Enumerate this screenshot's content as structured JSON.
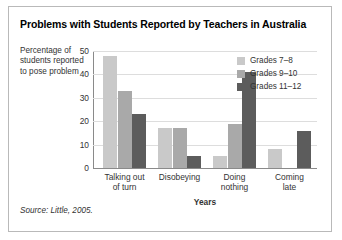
{
  "figure": {
    "title": "Problems with Students Reported by Teachers in Australia",
    "source_note": "Source: Little, 2005."
  },
  "chart_data": {
    "type": "bar",
    "title": "Problems with Students Reported by Teachers in Australia",
    "xlabel": "Years",
    "ylabel": "Percentage of students reported to pose problem",
    "categories": [
      "Talking out\nof turn",
      "Disobeying",
      "Doing\nnothing",
      "Coming\nlate"
    ],
    "series": [
      {
        "name": "Grades 7–8",
        "color": "#c9c9c9",
        "values": [
          48,
          17,
          5,
          8
        ]
      },
      {
        "name": "Grades 9–10",
        "color": "#a9a9a9",
        "values": [
          33,
          17,
          19,
          0
        ]
      },
      {
        "name": "Grades 11–12",
        "color": "#5c5c5c",
        "values": [
          23,
          5,
          41,
          16
        ]
      }
    ],
    "ylim": [
      0,
      50
    ],
    "yticks": [
      0,
      10,
      20,
      30,
      40,
      50
    ],
    "grid": true,
    "legend_position": "top-right"
  }
}
